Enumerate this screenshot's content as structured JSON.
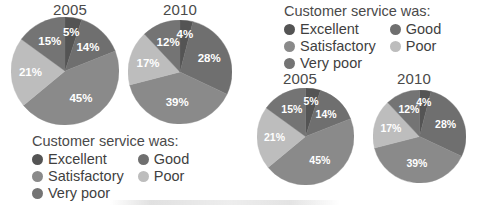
{
  "figure": {
    "legend_title": "Customer service was:",
    "categories": [
      "Excellent",
      "Good",
      "Satisfactory",
      "Poor",
      "Very poor"
    ],
    "colors": {
      "excellent": "#545454",
      "good": "#6f6f6f",
      "satisfactory": "#8a8a8a",
      "poor": "#bdbdbd",
      "very_poor": "#747474"
    },
    "legend_items": [
      {
        "label": "Excellent",
        "color": "#545454"
      },
      {
        "label": "Good",
        "color": "#6f6f6f"
      },
      {
        "label": "Satisfactory",
        "color": "#8a8a8a"
      },
      {
        "label": "Poor",
        "color": "#bdbdbd"
      },
      {
        "label": "Very poor",
        "color": "#747474"
      }
    ]
  },
  "panel_left": {
    "name": "legend-below-variant",
    "pie_2005_title": "2005",
    "pie_2010_title": "2010",
    "legend_title": "Customer service was:"
  },
  "panel_right": {
    "name": "legend-above-variant",
    "pie_2005_title": "2005",
    "pie_2010_title": "2010",
    "legend_title": "Customer service was:"
  },
  "labels": {
    "y2005": {
      "excellent": "5%",
      "good": "14%",
      "satisfactory": "45%",
      "poor": "21%",
      "very_poor": "15%"
    },
    "y2010": {
      "excellent": "4%",
      "good": "28%",
      "satisfactory": "39%",
      "poor": "17%",
      "very_poor": "12%"
    }
  },
  "chart_data": [
    {
      "type": "pie",
      "title": "2005",
      "categories": [
        "Excellent",
        "Good",
        "Satisfactory",
        "Poor",
        "Very poor"
      ],
      "values": [
        5,
        14,
        45,
        21,
        15
      ],
      "labels": [
        "5%",
        "14%",
        "45%",
        "21%",
        "15%"
      ],
      "colors": [
        "#545454",
        "#6f6f6f",
        "#8a8a8a",
        "#bdbdbd",
        "#747474"
      ],
      "legend_title": "Customer service was:",
      "legend_position": "below",
      "units": "percent",
      "start_angle_deg": 0,
      "direction": "clockwise"
    },
    {
      "type": "pie",
      "title": "2010",
      "categories": [
        "Excellent",
        "Good",
        "Satisfactory",
        "Poor",
        "Very poor"
      ],
      "values": [
        4,
        28,
        39,
        17,
        12
      ],
      "labels": [
        "4%",
        "28%",
        "39%",
        "17%",
        "12%"
      ],
      "colors": [
        "#545454",
        "#6f6f6f",
        "#8a8a8a",
        "#bdbdbd",
        "#747474"
      ],
      "legend_title": "Customer service was:",
      "legend_position": "below",
      "units": "percent",
      "start_angle_deg": 0,
      "direction": "clockwise"
    },
    {
      "type": "pie",
      "title": "2005",
      "categories": [
        "Excellent",
        "Good",
        "Satisfactory",
        "Poor",
        "Very poor"
      ],
      "values": [
        5,
        14,
        45,
        21,
        15
      ],
      "labels": [
        "5%",
        "14%",
        "45%",
        "21%",
        "15%"
      ],
      "colors": [
        "#545454",
        "#6f6f6f",
        "#8a8a8a",
        "#bdbdbd",
        "#747474"
      ],
      "legend_title": "Customer service was:",
      "legend_position": "above",
      "units": "percent",
      "start_angle_deg": 0,
      "direction": "clockwise"
    },
    {
      "type": "pie",
      "title": "2010",
      "categories": [
        "Excellent",
        "Good",
        "Satisfactory",
        "Poor",
        "Very poor"
      ],
      "values": [
        4,
        28,
        39,
        17,
        12
      ],
      "labels": [
        "4%",
        "28%",
        "39%",
        "17%",
        "12%"
      ],
      "colors": [
        "#545454",
        "#6f6f6f",
        "#8a8a8a",
        "#bdbdbd",
        "#747474"
      ],
      "legend_title": "Customer service was:",
      "legend_position": "above",
      "units": "percent",
      "start_angle_deg": 0,
      "direction": "clockwise"
    }
  ]
}
